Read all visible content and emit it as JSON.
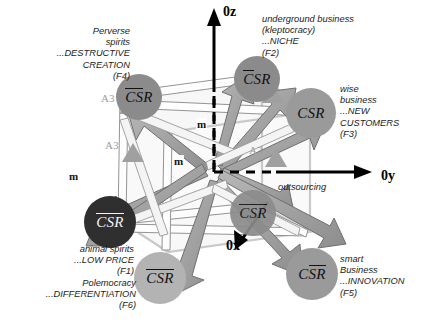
{
  "figure": {
    "type": "3d-cube-diagram",
    "axes": [
      {
        "name": "z-axis",
        "label": "0z"
      },
      {
        "name": "y-axis",
        "label": "0y"
      },
      {
        "name": "x-axis",
        "label": "0x"
      }
    ],
    "annotation": "outsourcing",
    "edge_label": "m",
    "marker_label": "A3"
  },
  "nodes": [
    {
      "id": "F4",
      "label_pre": "CS",
      "label_post": "R",
      "overline": "pre",
      "tone": "mid"
    },
    {
      "id": "F2",
      "label_pre": "C",
      "label_post": "SR",
      "overline": "pre",
      "tone": "mid"
    },
    {
      "id": "F3",
      "label_pre": "",
      "label_post": "CSR",
      "overline": "none",
      "tone": "grey"
    },
    {
      "id": "REAR",
      "label_pre": "CSR",
      "label_post": "",
      "overline": "pre",
      "tone": "mid"
    },
    {
      "id": "F1",
      "label_pre": "CSR",
      "label_post": "",
      "overline": "pre",
      "tone": "dark"
    },
    {
      "id": "F6",
      "label_pre": "CSR",
      "label_post": "",
      "overline": "pre",
      "tone": "light"
    },
    {
      "id": "F5",
      "label_pre": "C",
      "label_post": "SR",
      "overline": "post",
      "tone": "grey"
    },
    {
      "id": "F5b",
      "label_pre": "CS",
      "label_post": "R",
      "overline": "pre",
      "tone": "lighter"
    }
  ],
  "captions": [
    {
      "id": "F4",
      "text": "Perverse\nspirits\n...DESTRUCTIVE\nCREATION\n(F4)"
    },
    {
      "id": "F2",
      "text": "underground business\n(kleptocracy)\n...NICHE\n(F2)"
    },
    {
      "id": "F3",
      "text": "wise\nbusiness\n...NEW\nCUSTOMERS\n(F3)"
    },
    {
      "id": "F1",
      "text": "animal spirits\n...LOW PRICE\n(F1)"
    },
    {
      "id": "F6",
      "text": "Polemocracy\n...DIFFERENTIATION\n(F6)"
    },
    {
      "id": "F5",
      "text": "smart\nBusiness\n...INNOVATION\n(F5)"
    }
  ],
  "colors": {
    "node_dark": "#2f2f2f",
    "node_mid": "#8b8b8b",
    "node_light": "#b3b3b3",
    "arrow": "#9a9a9a",
    "axis": "#000000"
  }
}
